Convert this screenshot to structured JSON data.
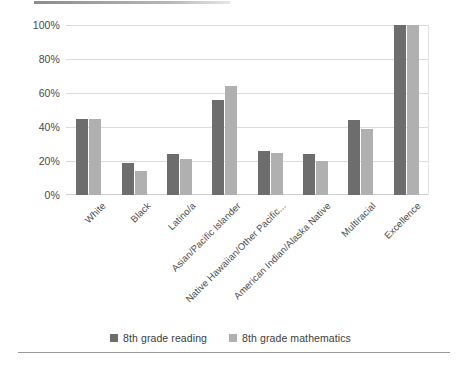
{
  "chart_data": {
    "type": "bar",
    "title": "",
    "subtitle": "",
    "xlabel": "",
    "ylabel": "",
    "ylim": [
      0,
      100
    ],
    "y_ticks": [
      "0%",
      "20%",
      "40%",
      "60%",
      "80%",
      "100%"
    ],
    "y_tick_values": [
      0,
      20,
      40,
      60,
      80,
      100
    ],
    "grid": true,
    "legend_position": "bottom",
    "categories": [
      "White",
      "Black",
      "Latino/a",
      "Asian/Pacific Islander",
      "Native Hawaiian/Other Pacific...",
      "American Indian/Alaska Native",
      "Multiracial",
      "Excellence"
    ],
    "series": [
      {
        "name": "8th grade reading",
        "color": "#6d6d6d",
        "values": [
          45,
          19,
          24,
          56,
          26,
          24,
          44,
          100
        ]
      },
      {
        "name": "8th grade mathematics",
        "color": "#b0b0b0",
        "values": [
          45,
          14,
          21,
          64,
          25,
          20,
          39,
          100
        ]
      }
    ]
  },
  "legend": {
    "items": [
      {
        "label": "8th grade reading",
        "color": "#6d6d6d"
      },
      {
        "label": "8th grade mathematics",
        "color": "#b0b0b0"
      }
    ]
  }
}
